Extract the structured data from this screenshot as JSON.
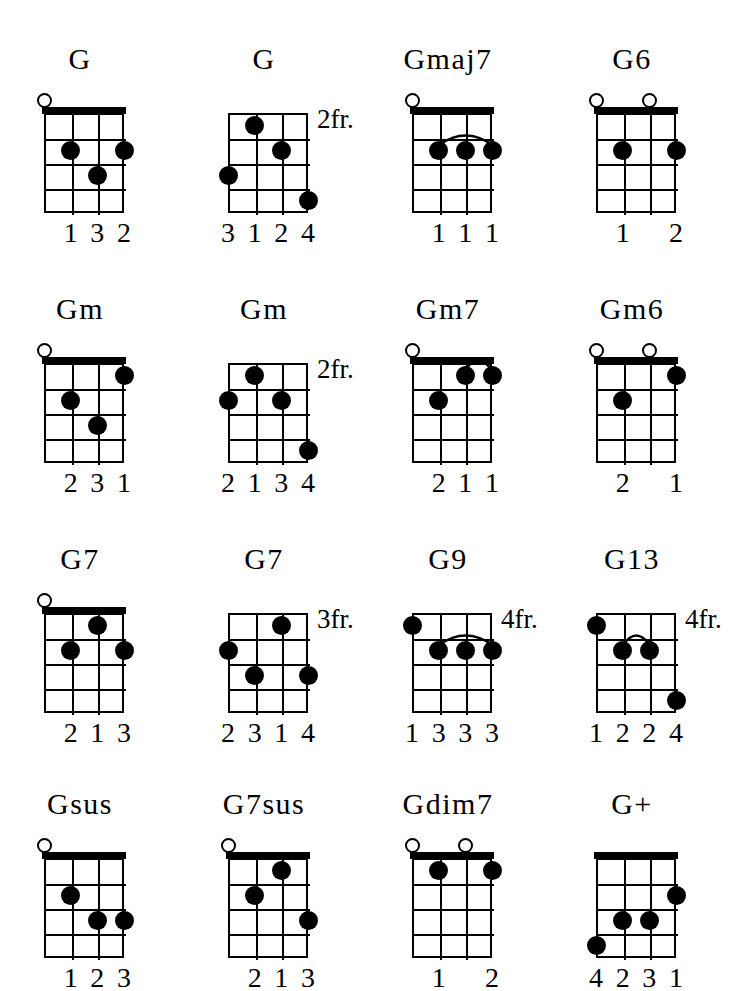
{
  "page": {
    "instrument": "4-string grid, 4 frets, 3 columns",
    "strings": 4,
    "frets": 4,
    "ink_color": "#000000",
    "background_color": "#ffffff"
  },
  "legend": {
    "open_string_symbol": "o",
    "fret_suffix": "fr.",
    "barre_symbol": "arc"
  },
  "chords": [
    {
      "name": "G",
      "fret_label": "",
      "nut": true,
      "open_strings": [
        1
      ],
      "dots": [
        {
          "string": 2,
          "fret": 2
        },
        {
          "string": 4,
          "fret": 2
        },
        {
          "string": 3,
          "fret": 3
        }
      ],
      "barres": [],
      "fingers": [
        {
          "string": 2,
          "label": "1"
        },
        {
          "string": 3,
          "label": "3"
        },
        {
          "string": 4,
          "label": "2"
        }
      ]
    },
    {
      "name": "G",
      "fret_label": "2fr.",
      "nut": false,
      "open_strings": [],
      "dots": [
        {
          "string": 2,
          "fret": 1
        },
        {
          "string": 3,
          "fret": 2
        },
        {
          "string": 1,
          "fret": 3
        },
        {
          "string": 4,
          "fret": 4
        }
      ],
      "barres": [],
      "fingers": [
        {
          "string": 1,
          "label": "3"
        },
        {
          "string": 2,
          "label": "1"
        },
        {
          "string": 3,
          "label": "2"
        },
        {
          "string": 4,
          "label": "4"
        }
      ]
    },
    {
      "name": "Gmaj7",
      "fret_label": "",
      "nut": true,
      "open_strings": [
        1
      ],
      "dots": [
        {
          "string": 2,
          "fret": 2
        },
        {
          "string": 3,
          "fret": 2
        },
        {
          "string": 4,
          "fret": 2
        }
      ],
      "barres": [
        {
          "from_string": 2,
          "to_string": 4,
          "fret": 2
        }
      ],
      "fingers": [
        {
          "string": 2,
          "label": "1"
        },
        {
          "string": 3,
          "label": "1"
        },
        {
          "string": 4,
          "label": "1"
        }
      ]
    },
    {
      "name": "G6",
      "fret_label": "",
      "nut": true,
      "open_strings": [
        1,
        3
      ],
      "dots": [
        {
          "string": 2,
          "fret": 2
        },
        {
          "string": 4,
          "fret": 2
        }
      ],
      "barres": [],
      "fingers": [
        {
          "string": 2,
          "label": "1"
        },
        {
          "string": 4,
          "label": "2"
        }
      ]
    },
    {
      "name": "Gm",
      "fret_label": "",
      "nut": true,
      "open_strings": [
        1
      ],
      "dots": [
        {
          "string": 4,
          "fret": 1
        },
        {
          "string": 2,
          "fret": 2
        },
        {
          "string": 3,
          "fret": 3
        }
      ],
      "barres": [],
      "fingers": [
        {
          "string": 2,
          "label": "2"
        },
        {
          "string": 3,
          "label": "3"
        },
        {
          "string": 4,
          "label": "1"
        }
      ]
    },
    {
      "name": "Gm",
      "fret_label": "2fr.",
      "nut": false,
      "open_strings": [],
      "dots": [
        {
          "string": 2,
          "fret": 1
        },
        {
          "string": 1,
          "fret": 2
        },
        {
          "string": 3,
          "fret": 2
        },
        {
          "string": 4,
          "fret": 4
        }
      ],
      "barres": [],
      "fingers": [
        {
          "string": 1,
          "label": "2"
        },
        {
          "string": 2,
          "label": "1"
        },
        {
          "string": 3,
          "label": "3"
        },
        {
          "string": 4,
          "label": "4"
        }
      ]
    },
    {
      "name": "Gm7",
      "fret_label": "",
      "nut": true,
      "open_strings": [
        1
      ],
      "dots": [
        {
          "string": 3,
          "fret": 1
        },
        {
          "string": 4,
          "fret": 1
        },
        {
          "string": 2,
          "fret": 2
        }
      ],
      "barres": [
        {
          "from_string": 3,
          "to_string": 4,
          "fret": 1
        }
      ],
      "fingers": [
        {
          "string": 2,
          "label": "2"
        },
        {
          "string": 3,
          "label": "1"
        },
        {
          "string": 4,
          "label": "1"
        }
      ]
    },
    {
      "name": "Gm6",
      "fret_label": "",
      "nut": true,
      "open_strings": [
        1,
        3
      ],
      "dots": [
        {
          "string": 4,
          "fret": 1
        },
        {
          "string": 2,
          "fret": 2
        }
      ],
      "barres": [],
      "fingers": [
        {
          "string": 2,
          "label": "2"
        },
        {
          "string": 4,
          "label": "1"
        }
      ]
    },
    {
      "name": "G7",
      "fret_label": "",
      "nut": true,
      "open_strings": [
        1
      ],
      "dots": [
        {
          "string": 3,
          "fret": 1
        },
        {
          "string": 2,
          "fret": 2
        },
        {
          "string": 4,
          "fret": 2
        }
      ],
      "barres": [],
      "fingers": [
        {
          "string": 2,
          "label": "2"
        },
        {
          "string": 3,
          "label": "1"
        },
        {
          "string": 4,
          "label": "3"
        }
      ]
    },
    {
      "name": "G7",
      "fret_label": "3fr.",
      "nut": false,
      "open_strings": [],
      "dots": [
        {
          "string": 3,
          "fret": 1
        },
        {
          "string": 1,
          "fret": 2
        },
        {
          "string": 2,
          "fret": 3
        },
        {
          "string": 4,
          "fret": 3
        }
      ],
      "barres": [],
      "fingers": [
        {
          "string": 1,
          "label": "2"
        },
        {
          "string": 2,
          "label": "3"
        },
        {
          "string": 3,
          "label": "1"
        },
        {
          "string": 4,
          "label": "4"
        }
      ]
    },
    {
      "name": "G9",
      "fret_label": "4fr.",
      "nut": false,
      "open_strings": [],
      "dots": [
        {
          "string": 1,
          "fret": 1
        },
        {
          "string": 2,
          "fret": 2
        },
        {
          "string": 3,
          "fret": 2
        },
        {
          "string": 4,
          "fret": 2
        }
      ],
      "barres": [
        {
          "from_string": 2,
          "to_string": 4,
          "fret": 2
        }
      ],
      "fingers": [
        {
          "string": 1,
          "label": "1"
        },
        {
          "string": 2,
          "label": "3"
        },
        {
          "string": 3,
          "label": "3"
        },
        {
          "string": 4,
          "label": "3"
        }
      ]
    },
    {
      "name": "G13",
      "fret_label": "4fr.",
      "nut": false,
      "open_strings": [],
      "dots": [
        {
          "string": 1,
          "fret": 1
        },
        {
          "string": 2,
          "fret": 2
        },
        {
          "string": 3,
          "fret": 2
        },
        {
          "string": 4,
          "fret": 4
        }
      ],
      "barres": [
        {
          "from_string": 2,
          "to_string": 3,
          "fret": 2
        }
      ],
      "fingers": [
        {
          "string": 1,
          "label": "1"
        },
        {
          "string": 2,
          "label": "2"
        },
        {
          "string": 3,
          "label": "2"
        },
        {
          "string": 4,
          "label": "4"
        }
      ]
    },
    {
      "name": "Gsus",
      "fret_label": "",
      "nut": true,
      "open_strings": [
        1
      ],
      "dots": [
        {
          "string": 2,
          "fret": 2
        },
        {
          "string": 3,
          "fret": 3
        },
        {
          "string": 4,
          "fret": 3
        }
      ],
      "barres": [],
      "fingers": [
        {
          "string": 2,
          "label": "1"
        },
        {
          "string": 3,
          "label": "2"
        },
        {
          "string": 4,
          "label": "3"
        }
      ]
    },
    {
      "name": "G7sus",
      "fret_label": "",
      "nut": true,
      "open_strings": [
        1
      ],
      "dots": [
        {
          "string": 3,
          "fret": 1
        },
        {
          "string": 2,
          "fret": 2
        },
        {
          "string": 4,
          "fret": 3
        }
      ],
      "barres": [],
      "fingers": [
        {
          "string": 2,
          "label": "2"
        },
        {
          "string": 3,
          "label": "1"
        },
        {
          "string": 4,
          "label": "3"
        }
      ]
    },
    {
      "name": "Gdim7",
      "fret_label": "",
      "nut": true,
      "open_strings": [
        1,
        3
      ],
      "dots": [
        {
          "string": 2,
          "fret": 1
        },
        {
          "string": 4,
          "fret": 1
        }
      ],
      "barres": [],
      "fingers": [
        {
          "string": 2,
          "label": "1"
        },
        {
          "string": 4,
          "label": "2"
        }
      ]
    },
    {
      "name": "G+",
      "fret_label": "",
      "nut": true,
      "open_strings": [],
      "dots": [
        {
          "string": 4,
          "fret": 2
        },
        {
          "string": 2,
          "fret": 3
        },
        {
          "string": 3,
          "fret": 3
        },
        {
          "string": 1,
          "fret": 4
        }
      ],
      "barres": [],
      "fingers": [
        {
          "string": 1,
          "label": "4"
        },
        {
          "string": 2,
          "label": "2"
        },
        {
          "string": 3,
          "label": "3"
        },
        {
          "string": 4,
          "label": "1"
        }
      ]
    }
  ]
}
